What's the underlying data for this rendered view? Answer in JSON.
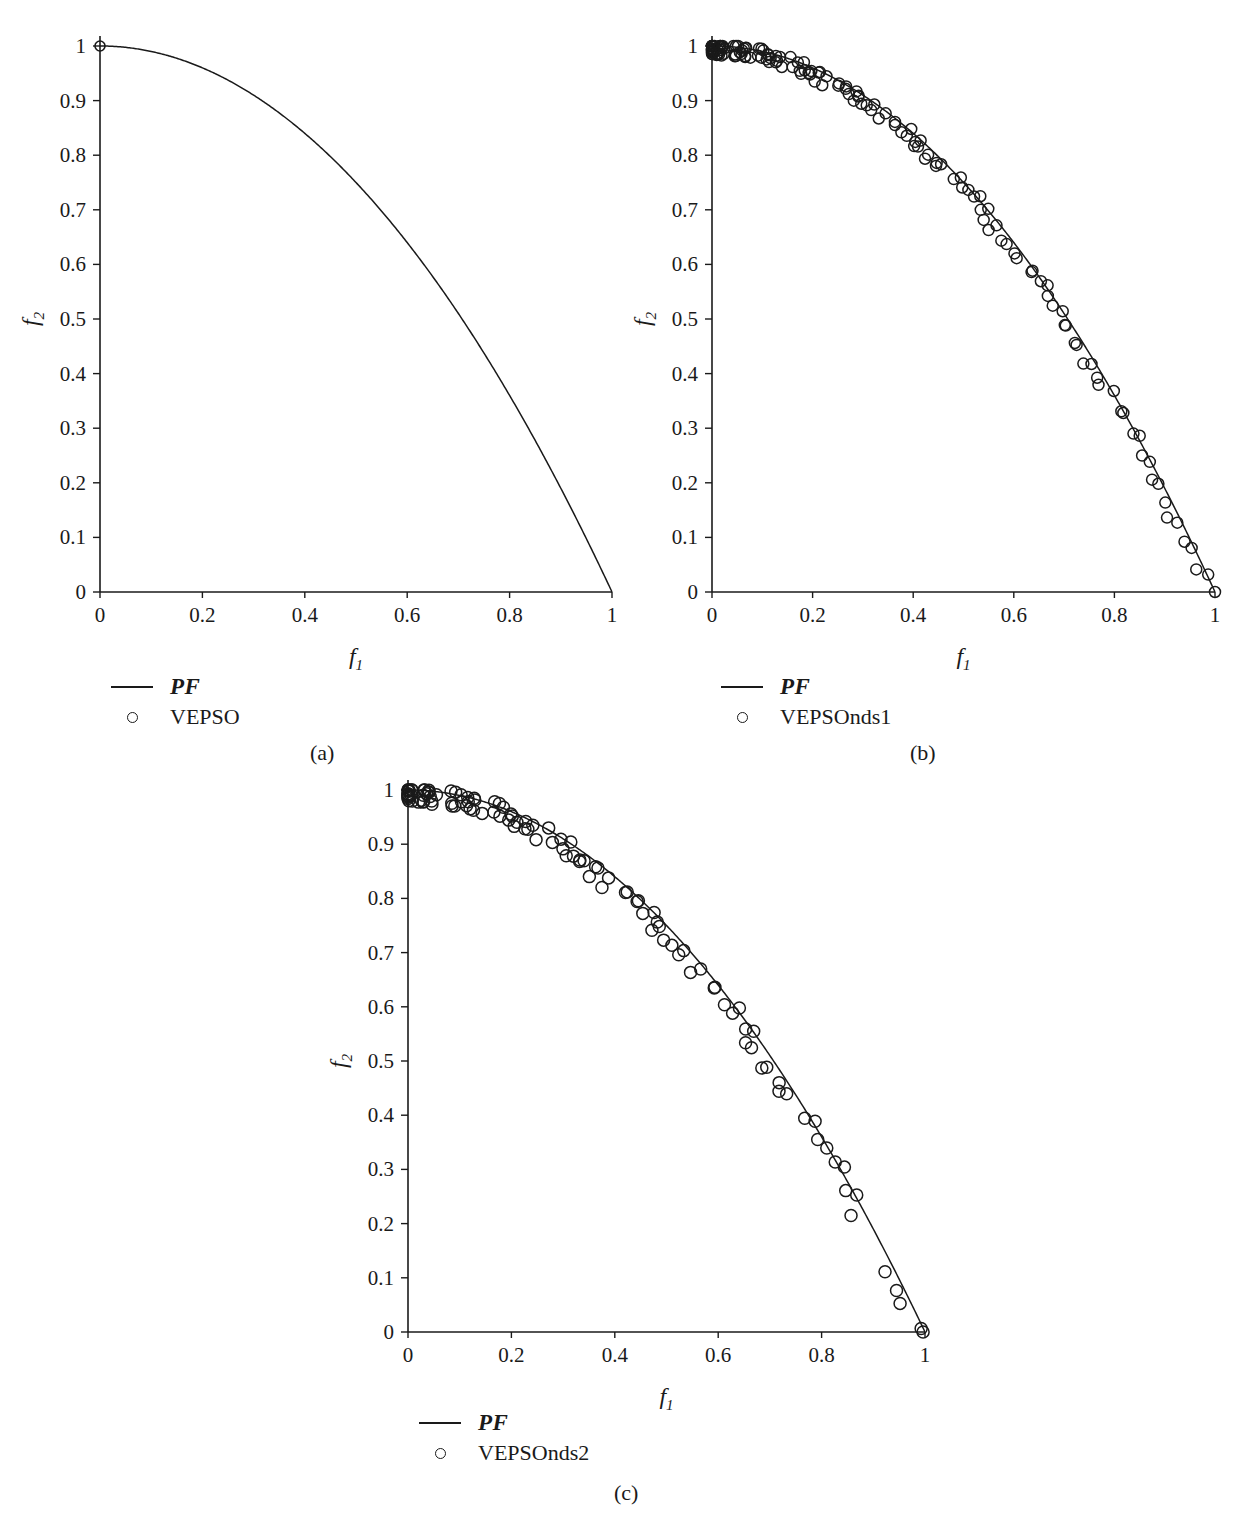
{
  "figure": {
    "panels": [
      {
        "id": "a",
        "caption": "(a)",
        "xlabel": "f",
        "xlabel_sub": "1",
        "ylabel": "f",
        "ylabel_sub": "2",
        "xticks": [
          "0",
          "0.2",
          "0.4",
          "0.6",
          "0.8",
          "1"
        ],
        "yticks": [
          "0",
          "0.1",
          "0.2",
          "0.3",
          "0.4",
          "0.5",
          "0.6",
          "0.7",
          "0.8",
          "0.9",
          "1"
        ],
        "legend": [
          {
            "marker": "line",
            "label": "PF",
            "script": true
          },
          {
            "marker": "circle",
            "label": "VEPSO",
            "script": false
          }
        ]
      },
      {
        "id": "b",
        "caption": "(b)",
        "xlabel": "f",
        "xlabel_sub": "1",
        "ylabel": "f",
        "ylabel_sub": "2",
        "xticks": [
          "0",
          "0.2",
          "0.4",
          "0.6",
          "0.8",
          "1"
        ],
        "yticks": [
          "0",
          "0.1",
          "0.2",
          "0.3",
          "0.4",
          "0.5",
          "0.6",
          "0.7",
          "0.8",
          "0.9",
          "1"
        ],
        "legend": [
          {
            "marker": "line",
            "label": "PF",
            "script": true
          },
          {
            "marker": "circle",
            "label": "VEPSOnds1",
            "script": false
          }
        ]
      },
      {
        "id": "c",
        "caption": "(c)",
        "xlabel": "f",
        "xlabel_sub": "1",
        "ylabel": "f",
        "ylabel_sub": "2",
        "xticks": [
          "0",
          "0.2",
          "0.4",
          "0.6",
          "0.8",
          "1"
        ],
        "yticks": [
          "0",
          "0.1",
          "0.2",
          "0.3",
          "0.4",
          "0.5",
          "0.6",
          "0.7",
          "0.8",
          "0.9",
          "1"
        ],
        "legend": [
          {
            "marker": "line",
            "label": "PF",
            "script": true
          },
          {
            "marker": "circle",
            "label": "VEPSOnds2",
            "script": false
          }
        ]
      }
    ],
    "colors": {
      "ink": "#1a1a1a",
      "background": "#ffffff"
    }
  },
  "chart_data": [
    {
      "type": "line",
      "panel": "a",
      "title": "",
      "xlabel": "f1",
      "ylabel": "f2",
      "xlim": [
        0,
        1
      ],
      "ylim": [
        0,
        1
      ],
      "grid": false,
      "legend_position": "below-left",
      "series": [
        {
          "name": "PF",
          "kind": "line",
          "description": "True Pareto front f2 = 1 - f1^2",
          "x": [
            0,
            0.05,
            0.1,
            0.15,
            0.2,
            0.25,
            0.3,
            0.35,
            0.4,
            0.45,
            0.5,
            0.55,
            0.6,
            0.65,
            0.7,
            0.75,
            0.8,
            0.85,
            0.9,
            0.95,
            1.0
          ],
          "y": [
            1.0,
            0.776,
            0.684,
            0.613,
            0.553,
            0.5,
            0.452,
            0.408,
            0.368,
            0.329,
            0.293,
            0.259,
            0.226,
            0.194,
            0.164,
            0.134,
            0.106,
            0.078,
            0.051,
            0.025,
            0.0
          ]
        },
        {
          "name": "VEPSO",
          "kind": "scatter",
          "description": "Single converged solution at the extreme point",
          "x": [
            0.0
          ],
          "y": [
            1.0
          ]
        }
      ]
    },
    {
      "type": "line",
      "panel": "b",
      "title": "",
      "xlabel": "f1",
      "ylabel": "f2",
      "xlim": [
        0,
        1
      ],
      "ylim": [
        0,
        1
      ],
      "grid": false,
      "legend_position": "below-left",
      "series": [
        {
          "name": "PF",
          "kind": "line",
          "description": "True Pareto front f2 = 1 - f1^2",
          "x": [
            0,
            0.05,
            0.1,
            0.15,
            0.2,
            0.25,
            0.3,
            0.35,
            0.4,
            0.45,
            0.5,
            0.55,
            0.6,
            0.65,
            0.7,
            0.75,
            0.8,
            0.85,
            0.9,
            0.95,
            1.0
          ],
          "y": [
            1.0,
            0.776,
            0.684,
            0.613,
            0.553,
            0.5,
            0.452,
            0.408,
            0.368,
            0.329,
            0.293,
            0.259,
            0.226,
            0.194,
            0.164,
            0.134,
            0.106,
            0.078,
            0.051,
            0.025,
            0.0
          ]
        },
        {
          "name": "VEPSOnds1",
          "kind": "scatter",
          "description": "Dense, uniformly distributed non-dominated set lying on the front (approx. 150 points)",
          "n_points": 150,
          "coverage": "full front from (0,1) to (1,0)"
        }
      ]
    },
    {
      "type": "line",
      "panel": "c",
      "title": "",
      "xlabel": "f1",
      "ylabel": "f2",
      "xlim": [
        0,
        1
      ],
      "ylim": [
        0,
        1
      ],
      "grid": false,
      "legend_position": "below-left",
      "series": [
        {
          "name": "PF",
          "kind": "line",
          "description": "True Pareto front f2 = 1 - f1^2",
          "x": [
            0,
            0.05,
            0.1,
            0.15,
            0.2,
            0.25,
            0.3,
            0.35,
            0.4,
            0.45,
            0.5,
            0.55,
            0.6,
            0.65,
            0.7,
            0.75,
            0.8,
            0.85,
            0.9,
            0.95,
            1.0
          ],
          "y": [
            1.0,
            0.776,
            0.684,
            0.613,
            0.553,
            0.5,
            0.452,
            0.408,
            0.368,
            0.329,
            0.293,
            0.259,
            0.226,
            0.194,
            0.164,
            0.134,
            0.106,
            0.078,
            0.051,
            0.025,
            0.0
          ]
        },
        {
          "name": "VEPSOnds2",
          "kind": "scatter",
          "description": "Dense non-dominated set on the front with sparser spacing and a small gap near f1 = 0.9",
          "n_points": 120,
          "coverage": "full front from (0,1) to (1,0) with a gap around f1 0.90-0.96"
        }
      ]
    }
  ]
}
